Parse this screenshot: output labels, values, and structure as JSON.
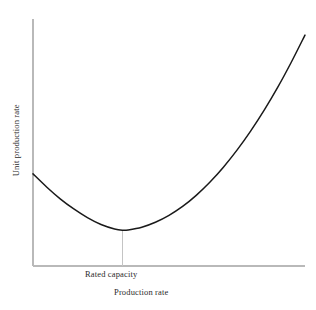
{
  "chart_data": {
    "type": "line",
    "title": "",
    "subtitle": "",
    "xlabel": "Production rate",
    "ylabel": "Unit production rate",
    "grid": false,
    "legend": null,
    "annotations": [
      {
        "text": "Rated capacity",
        "kind": "x-tick-label",
        "at_x_fraction": 0.33,
        "description": "Label marking the production rate at which unit production rate is minimized"
      }
    ],
    "axis": {
      "x_axis_shown": true,
      "y_axis_shown": true,
      "x_ticks": [
        "Rated capacity"
      ],
      "y_ticks": [],
      "x_tick_values": [
        0.33
      ],
      "xlim": [
        0,
        1
      ],
      "ylim": [
        0,
        1
      ],
      "axis_color": "#b9b9b9"
    },
    "series": [
      {
        "name": "Unit production rate curve",
        "color": "#1a1a1a",
        "shape": "u-shaped convex curve with minimum at rated capacity",
        "x": [
          0.0,
          0.05,
          0.1,
          0.15,
          0.2,
          0.25,
          0.3,
          0.33,
          0.35,
          0.4,
          0.45,
          0.5,
          0.55,
          0.6,
          0.65,
          0.7,
          0.75,
          0.8,
          0.85,
          0.9,
          0.95,
          1.0
        ],
        "y": [
          0.373,
          0.32,
          0.272,
          0.231,
          0.196,
          0.168,
          0.15,
          0.145,
          0.146,
          0.157,
          0.177,
          0.205,
          0.241,
          0.286,
          0.339,
          0.4,
          0.469,
          0.546,
          0.631,
          0.724,
          0.826,
          0.935
        ]
      }
    ],
    "marker_line": {
      "name": "rated-capacity-drop-line",
      "x": 0.33,
      "from_y": 0.145,
      "to_y": 0.0,
      "color": "#c4c4c4"
    }
  },
  "labels": {
    "y_axis_title": "Unit production rate",
    "x_axis_title": "Production rate",
    "rated_capacity": "Rated capacity"
  },
  "colors": {
    "background": "#ffffff",
    "curve": "#1a1a1a",
    "axis": "#b9b9b9",
    "drop_line": "#c4c4c4",
    "text": "#2b2b2b"
  }
}
